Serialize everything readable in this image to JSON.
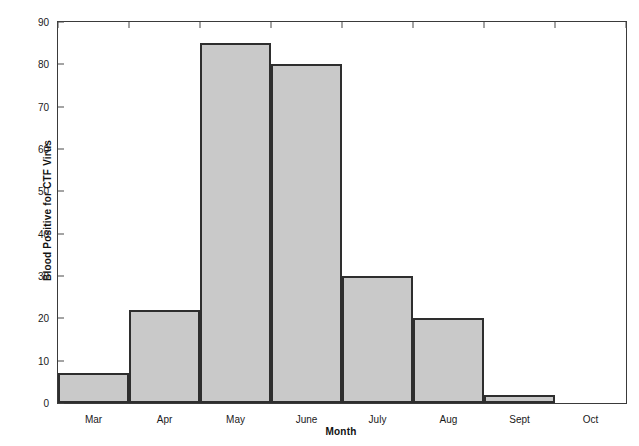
{
  "chart_data": {
    "type": "bar",
    "title": "",
    "subtitle": "",
    "xlabel": "Month",
    "ylabel": "Blood Positive for CTF Virus",
    "categories": [
      "Mar",
      "Apr",
      "May",
      "June",
      "July",
      "Aug",
      "Sept",
      "Oct"
    ],
    "values": [
      7,
      22,
      85,
      80,
      30,
      20,
      2,
      0
    ],
    "ylim": [
      0,
      90
    ],
    "ytick_labels": [
      "0",
      "10",
      "20",
      "30",
      "40",
      "50",
      "60",
      "70",
      "80",
      "90"
    ],
    "ytick_values": [
      0,
      10,
      20,
      30,
      40,
      50,
      60,
      70,
      80,
      90
    ],
    "grid": false,
    "legend": null,
    "legend_position": "none",
    "bar_fill_color": "#c9c9c9",
    "bar_edge_color": "#2e2e2e",
    "axis_color": "#3a3a3a",
    "background_color": "#ffffff"
  }
}
